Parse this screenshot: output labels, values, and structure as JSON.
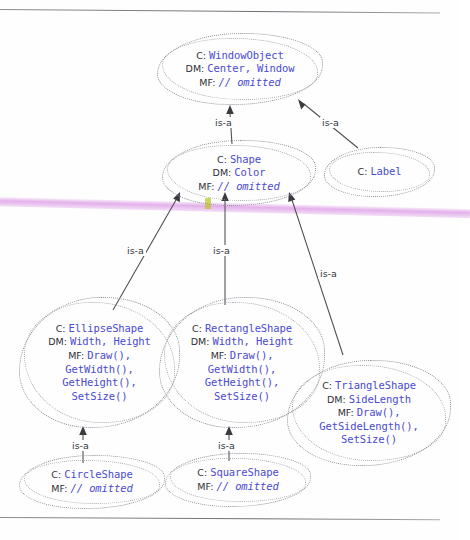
{
  "page": {
    "background_color": "#fefefe",
    "rule_color": "#6e6e76"
  },
  "annotations": {
    "pink_highlight_color": "#dd9ee6",
    "yellow_highlight_color": "#bec428",
    "pink_label": "pink-highlighter-stroke",
    "yellow_label": "yellow-highlighter-mark"
  },
  "labels": {
    "class_tag": "C:",
    "data_members_tag": "DM:",
    "member_functions_tag": "MF:",
    "omitted": "// omitted",
    "is_a": "is-a"
  },
  "nodes": [
    {
      "id": "windowobject",
      "name": "WindowObject",
      "data_members": "Center, Window",
      "member_functions": "// omitted"
    },
    {
      "id": "shape",
      "name": "Shape",
      "data_members": "Color",
      "member_functions": "// omitted"
    },
    {
      "id": "label",
      "name": "Label"
    },
    {
      "id": "ellipseshape",
      "name": "EllipseShape",
      "data_members": "Width, Height",
      "member_functions_lines": [
        "Draw(),",
        "GetWidth(),",
        "GetHeight(),",
        "SetSize()"
      ]
    },
    {
      "id": "rectangleshape",
      "name": "RectangleShape",
      "data_members": "Width, Height",
      "member_functions_lines": [
        "Draw(),",
        "GetWidth(),",
        "GetHeight(),",
        "SetSize()"
      ]
    },
    {
      "id": "triangleshape",
      "name": "TriangleShape",
      "data_members": "SideLength",
      "member_functions_lines": [
        "Draw(),",
        "GetSideLength(),",
        "SetSize()"
      ]
    },
    {
      "id": "circleshape",
      "name": "CircleShape",
      "member_functions": "// omitted"
    },
    {
      "id": "squareshape",
      "name": "SquareShape",
      "member_functions": "// omitted"
    }
  ],
  "edges": [
    {
      "from": "shape",
      "to": "windowobject",
      "label": "is-a"
    },
    {
      "from": "label",
      "to": "windowobject",
      "label": "is-a"
    },
    {
      "from": "ellipseshape",
      "to": "shape",
      "label": "is-a"
    },
    {
      "from": "rectangleshape",
      "to": "shape",
      "label": "is-a"
    },
    {
      "from": "triangleshape",
      "to": "shape",
      "label": "is-a"
    },
    {
      "from": "circleshape",
      "to": "ellipseshape",
      "label": "is-a"
    },
    {
      "from": "squareshape",
      "to": "rectangleshape",
      "label": "is-a"
    }
  ]
}
